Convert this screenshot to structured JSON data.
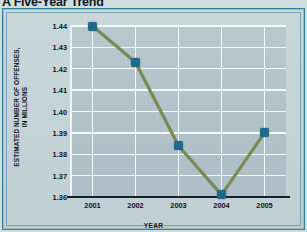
{
  "chart_title": "A Five-Year Trend",
  "axes": {
    "ylabel": "ESTIMATED NUMBER OF OFFENSES,\nIN MILLIONS",
    "xlabel": "YEAR"
  },
  "colors": {
    "line": "#7b8a55",
    "marker": "#1d6a8c",
    "plot_background": "#b4c4cb",
    "gridline": "#f4f8f9",
    "frame_border": "#2f7f96",
    "axis": "#13202a"
  },
  "chart_data": {
    "type": "line",
    "title": "A Five-Year Trend",
    "xlabel": "YEAR",
    "ylabel": "ESTIMATED NUMBER OF OFFENSES, IN MILLIONS",
    "categories": [
      "2001",
      "2002",
      "2003",
      "2004",
      "2005"
    ],
    "values": [
      1.44,
      1.423,
      1.384,
      1.361,
      1.39
    ],
    "ylim": [
      1.36,
      1.44
    ],
    "yticks": [
      "1.36",
      "1.37",
      "1.38",
      "1.39",
      "1.40",
      "1.41",
      "1.42",
      "1.43",
      "1.44"
    ],
    "ytick_values": [
      1.36,
      1.37,
      1.38,
      1.39,
      1.4,
      1.41,
      1.42,
      1.43,
      1.44
    ],
    "grid": true,
    "legend": "none",
    "series": [
      {
        "name": "Estimated number of offenses",
        "values": [
          1.44,
          1.423,
          1.384,
          1.361,
          1.39
        ]
      }
    ]
  }
}
